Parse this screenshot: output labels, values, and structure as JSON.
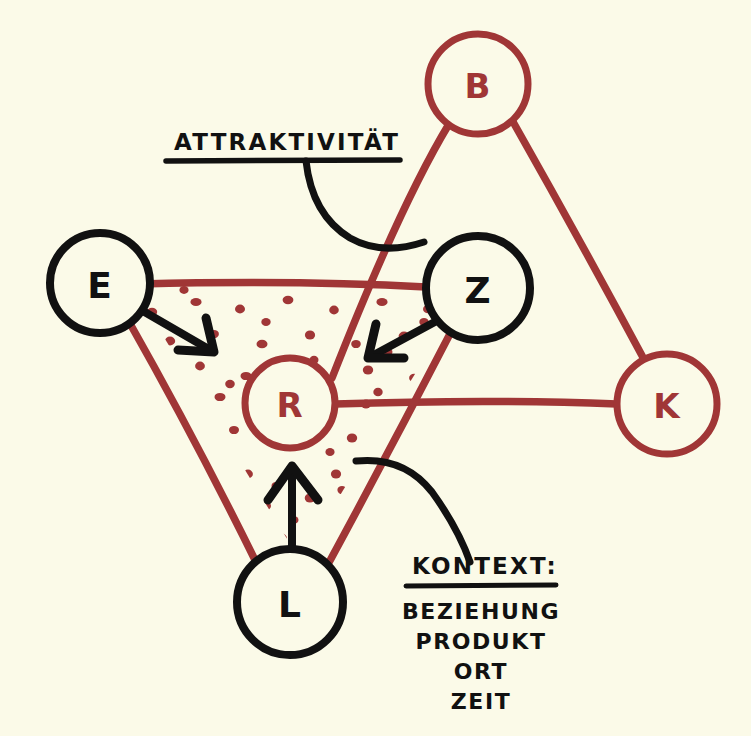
{
  "canvas": {
    "width": 751,
    "height": 736,
    "background_color": "#fbfae8",
    "style": "hand-drawn-sketch"
  },
  "palette": {
    "red": "#a03636",
    "black": "#111111",
    "paper": "#fbfae8"
  },
  "nodes": [
    {
      "id": "B",
      "label": "B",
      "color": "red",
      "cx": 478,
      "cy": 84,
      "r": 50
    },
    {
      "id": "E",
      "label": "E",
      "color": "black",
      "cx": 100,
      "cy": 283,
      "r": 50
    },
    {
      "id": "Z",
      "label": "Z",
      "color": "black",
      "cx": 478,
      "cy": 288,
      "r": 52
    },
    {
      "id": "R",
      "label": "R",
      "color": "red",
      "cx": 290,
      "cy": 403,
      "r": 45
    },
    {
      "id": "K",
      "label": "K",
      "color": "red",
      "cx": 667,
      "cy": 404,
      "r": 50
    },
    {
      "id": "L",
      "label": "L",
      "color": "black",
      "cx": 290,
      "cy": 602,
      "r": 53
    }
  ],
  "edges": [
    {
      "from": "E",
      "to": "Z",
      "color": "red",
      "kind": "line"
    },
    {
      "from": "E",
      "to": "L",
      "color": "red",
      "kind": "line"
    },
    {
      "from": "Z",
      "to": "L",
      "color": "red",
      "kind": "line"
    },
    {
      "from": "B",
      "to": "R",
      "color": "red",
      "kind": "line"
    },
    {
      "from": "B",
      "to": "K",
      "color": "red",
      "kind": "line"
    },
    {
      "from": "R",
      "to": "K",
      "color": "red",
      "kind": "line"
    }
  ],
  "arrows": [
    {
      "from": "E",
      "to": "R",
      "color": "black"
    },
    {
      "from": "Z",
      "to": "R",
      "color": "black"
    },
    {
      "from": "L",
      "to": "R",
      "color": "black"
    }
  ],
  "shading": {
    "region": "triangle-E-Z-L",
    "pattern": "stipple-dots",
    "color": "red"
  },
  "annotations": {
    "attractiveness": {
      "title": "ATTRAKTIVITÄT",
      "underlined": true,
      "leader": "curve-to-center"
    },
    "context": {
      "title": "KONTEXT:",
      "underlined": true,
      "leader": "curve-to-center",
      "items": [
        "BEZIEHUNG",
        "PRODUKT",
        "ORT",
        "ZEIT"
      ]
    }
  }
}
